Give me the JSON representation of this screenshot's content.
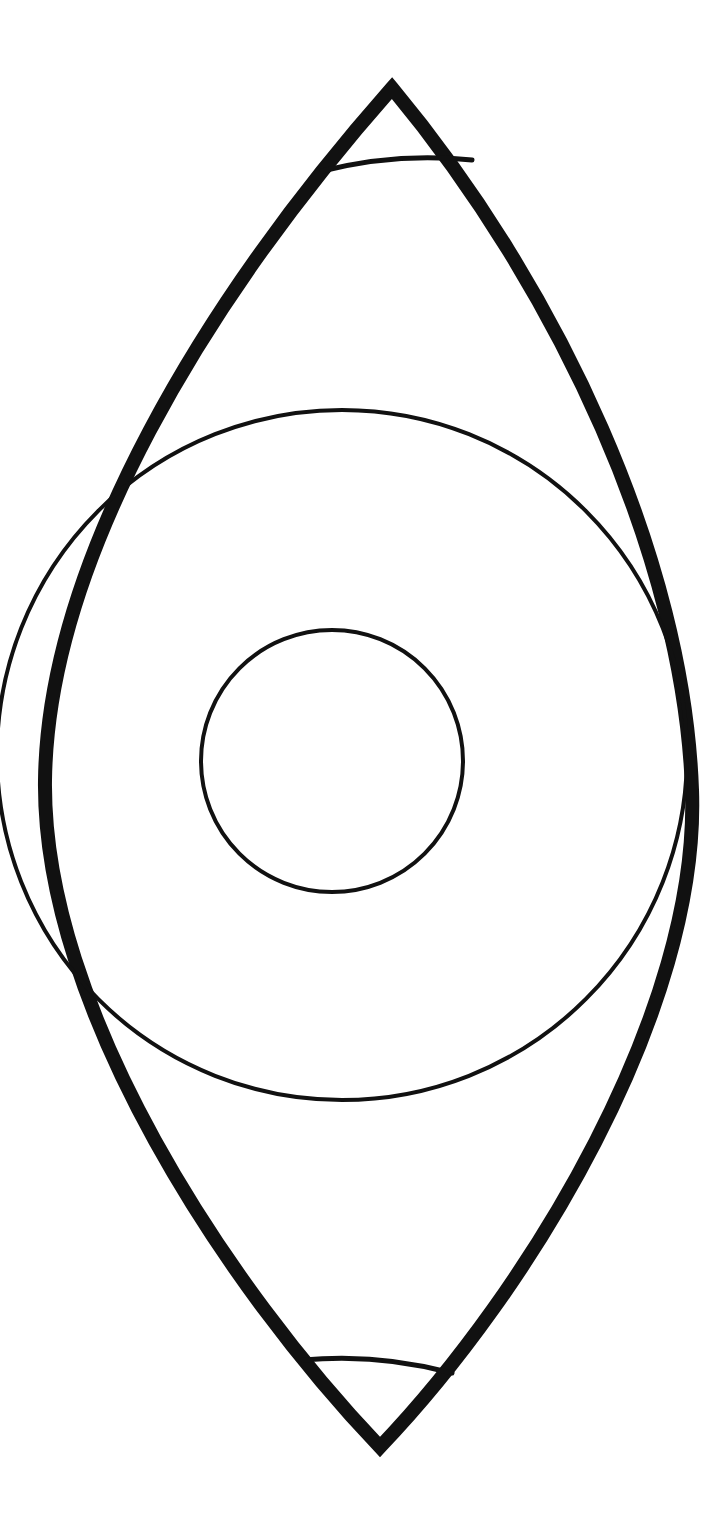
{
  "page": {
    "width": 728,
    "height": 1519,
    "background_color": "#ffffff",
    "ink_color": "#111111"
  },
  "figure": {
    "type": "line-drawing",
    "stroke_color": "#111111",
    "fill": "none",
    "shapes": [
      {
        "id": "outer-lens",
        "name": "outer-lens-outline",
        "kind": "vesica",
        "stroke_width": 14,
        "top_apex": [
          392,
          88
        ],
        "bottom_apex": [
          380,
          1447
        ],
        "left_extreme": [
          45,
          780
        ],
        "right_extreme": [
          692,
          790
        ],
        "path": "M 392 88 C 205 300 48 560 45 780 C 42 1010 230 1290 380 1447 C 530 1290 700 1010 692 790 C 684 560 560 290 392 88 Z"
      },
      {
        "id": "large-circle",
        "name": "large-inner-circle",
        "kind": "circle",
        "stroke_width": 4,
        "center": [
          342,
          755
        ],
        "radius": 345
      },
      {
        "id": "small-circle",
        "name": "small-inner-circle",
        "kind": "circle",
        "stroke_width": 4,
        "center": [
          332,
          761
        ],
        "radius": 131
      },
      {
        "id": "top-chord",
        "name": "top-chord-arc",
        "kind": "arc",
        "stroke_width": 5,
        "start": [
          322,
          171
        ],
        "end": [
          472,
          160
        ],
        "control": [
          397,
          152
        ]
      },
      {
        "id": "bottom-chord",
        "name": "bottom-chord-arc",
        "kind": "arc",
        "stroke_width": 5,
        "start": [
          303,
          1360
        ],
        "end": [
          452,
          1373
        ],
        "control": [
          378,
          1353
        ]
      }
    ]
  }
}
